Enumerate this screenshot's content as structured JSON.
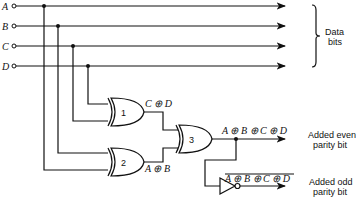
{
  "inputs": [
    {
      "name": "A",
      "y": 6
    },
    {
      "name": "B",
      "y": 26
    },
    {
      "name": "C",
      "y": 46
    },
    {
      "name": "D",
      "y": 66
    }
  ],
  "brace_label": [
    "Data",
    "bits"
  ],
  "gates": [
    {
      "id": "1",
      "type": "XOR"
    },
    {
      "id": "2",
      "type": "XOR"
    },
    {
      "id": "3",
      "type": "XOR"
    },
    {
      "id": "inv",
      "type": "NOT"
    }
  ],
  "expressions": {
    "gate1_out": "C ⊕ D",
    "gate2_out": "A ⊕ B",
    "gate3_out": "A ⊕ B ⊕ C ⊕ D",
    "inv_out": "A ⊕ B ⊕ C ⊕ D"
  },
  "outputs": {
    "even": [
      "Added even",
      "parity bit"
    ],
    "odd": [
      "Added odd",
      "parity bit"
    ]
  },
  "colors": {
    "ink": "#111111",
    "background": "#ffffff"
  }
}
